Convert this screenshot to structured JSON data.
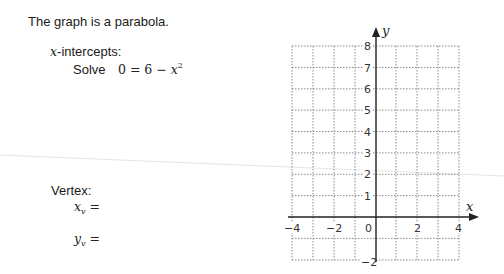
{
  "intro": {
    "text": "The graph is a parabola."
  },
  "intercepts": {
    "heading_var": "x",
    "heading_rest": "-intercepts:",
    "solve_label": "Solve",
    "equation_lhs": "0 = 6 − ",
    "equation_var": "x",
    "equation_exp": "2"
  },
  "vertex": {
    "heading": "Vertex:",
    "xv_var": "x",
    "xv_sub": "v",
    "xv_eq": " =",
    "yv_var": "y",
    "yv_sub": "v",
    "yv_eq": " ="
  },
  "graph": {
    "x_axis_label": "x",
    "y_axis_label": "y",
    "x_tick_labels": [
      "−4",
      "−2",
      "0",
      "2",
      "4"
    ],
    "y_tick_labels": [
      "8",
      "7",
      "6",
      "5",
      "4",
      "3",
      "2",
      "1",
      "−2"
    ],
    "x_range": [
      -4,
      4
    ],
    "y_range": [
      -2,
      8
    ],
    "grid_color": "#8a8a8a",
    "axis_color": "#222222"
  }
}
